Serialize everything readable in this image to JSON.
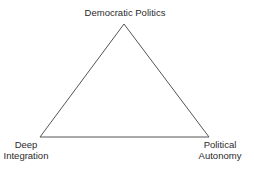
{
  "diagram": {
    "type": "triangle",
    "vertices": {
      "top": {
        "label": "Democratic Politics"
      },
      "bottom_left": {
        "line1": "Deep",
        "line2": "Integration"
      },
      "bottom_right": {
        "line1": "Political",
        "line2": "Autonomy"
      }
    },
    "line_color": "#555555"
  }
}
